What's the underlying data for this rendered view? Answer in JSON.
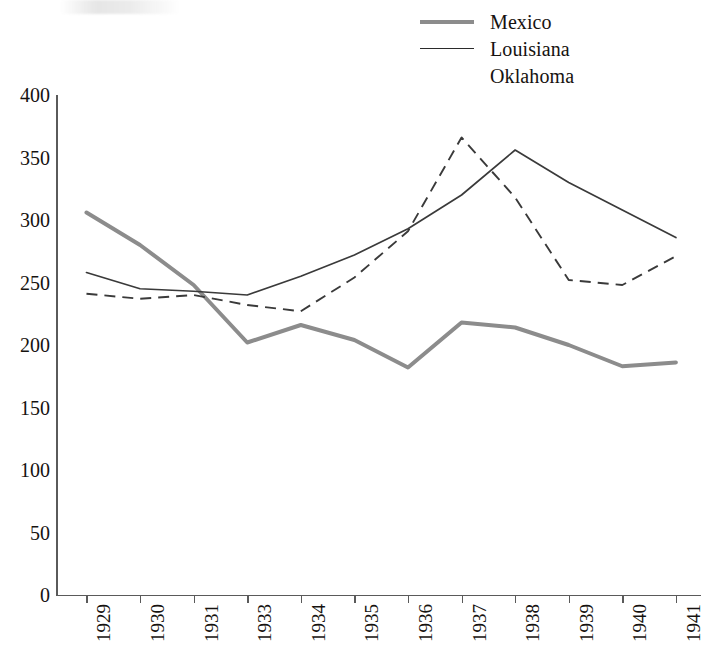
{
  "chart_data": {
    "type": "line",
    "title": "",
    "subtitle": "",
    "xlabel": "",
    "ylabel": "",
    "categories": [
      "1929",
      "1930",
      "1931",
      "1933",
      "1934",
      "1935",
      "1936",
      "1937",
      "1938",
      "1939",
      "1940",
      "1941"
    ],
    "ylim": [
      0,
      400
    ],
    "yticks": [
      0,
      50,
      100,
      150,
      200,
      250,
      300,
      350,
      400
    ],
    "ytick_labels": [
      "0",
      "50",
      "100",
      "150",
      "200",
      "250",
      "300",
      "350",
      "400"
    ],
    "grid": false,
    "legend_position": "top-right",
    "series": [
      {
        "name": "Mexico",
        "style": "solid-thick",
        "color": "#8c8c8c",
        "values": [
          306,
          280,
          248,
          202,
          216,
          204,
          182,
          218,
          214,
          200,
          183,
          186
        ]
      },
      {
        "name": "Louisiana",
        "style": "solid-thin",
        "color": "#3a3a3a",
        "values": [
          258,
          245,
          243,
          240,
          255,
          272,
          293,
          320,
          356,
          330,
          308,
          286
        ]
      },
      {
        "name": "Oklahoma",
        "style": "dashed",
        "color": "#3a3a3a",
        "values": [
          241,
          237,
          240,
          232,
          227,
          254,
          291,
          366,
          318,
          252,
          248,
          271
        ]
      }
    ]
  },
  "legend": {
    "items": [
      {
        "label": "Mexico",
        "swatch": "thick-gray-line-swatch"
      },
      {
        "label": "Louisiana",
        "swatch": "thin-black-line-swatch"
      },
      {
        "label": "Oklahoma",
        "swatch": "dashed-black-line-swatch"
      }
    ]
  }
}
